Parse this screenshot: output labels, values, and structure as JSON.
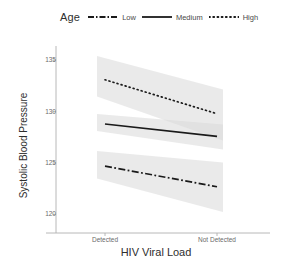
{
  "chart_data": {
    "type": "line",
    "title": "",
    "xlabel": "HIV Viral Load",
    "ylabel": "Systolic Blood Pressure",
    "legend_title": "Age",
    "legend_position": "top",
    "grid": false,
    "x": [
      "Detected",
      "Not Detected"
    ],
    "xtick_labels": [
      "Detected",
      "Not Detected"
    ],
    "ytick_labels": [
      "135",
      "130",
      "125",
      "120"
    ],
    "ytick_values": [
      135,
      130,
      125,
      120
    ],
    "ylim": [
      118.2,
      135.8
    ],
    "series": [
      {
        "name": "Low",
        "linestyle": "dash-dot",
        "color": "#1a1a1a",
        "values": [
          124.7,
          122.7
        ],
        "ci_lower": [
          123.3,
          120.4
        ],
        "ci_upper": [
          126.1,
          125.1
        ]
      },
      {
        "name": "Medium",
        "linestyle": "solid",
        "color": "#1a1a1a",
        "values": [
          128.8,
          127.6
        ],
        "ci_lower": [
          128.0,
          126.4
        ],
        "ci_upper": [
          129.7,
          128.8
        ]
      },
      {
        "name": "High",
        "linestyle": "dotted",
        "color": "#1a1a1a",
        "values": [
          133.1,
          129.8
        ],
        "ci_lower": [
          131.2,
          127.4
        ],
        "ci_upper": [
          135.2,
          132.3
        ]
      }
    ],
    "band_color": "#d9d9d9",
    "band_opacity": 0.55,
    "axis_color": "#b0b0b0"
  }
}
